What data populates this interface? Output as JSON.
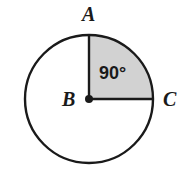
{
  "figure": {
    "kind": "circle-with-shaded-quarter-sector",
    "background_color": "#ffffff",
    "stroke_color": "#1a1a1a",
    "sector_fill_color": "#d2d2d2",
    "sector_label": "90°",
    "labels": {
      "center_point": "B",
      "top_point": "A",
      "right_point": "C"
    },
    "geometry": {
      "center_x": 89,
      "center_y": 99,
      "radius": 64,
      "sector_start_label": "A",
      "sector_end_label": "C",
      "sector_sweep_degrees": 90,
      "circle_stroke_width": 2.4,
      "radius_stroke_width": 2.4,
      "center_dot_radius": 4
    }
  },
  "chart_data": {
    "type": "pie",
    "title": "",
    "categories": [
      "Shaded sector ABC",
      "Unshaded remainder"
    ],
    "values": [
      90,
      270
    ],
    "labels": [
      "90°",
      ""
    ],
    "colors": [
      "#d2d2d2",
      "#ffffff"
    ],
    "units": "degrees",
    "total": 360,
    "legend": "none",
    "annotations": [
      "A",
      "B",
      "C",
      "90°"
    ]
  }
}
